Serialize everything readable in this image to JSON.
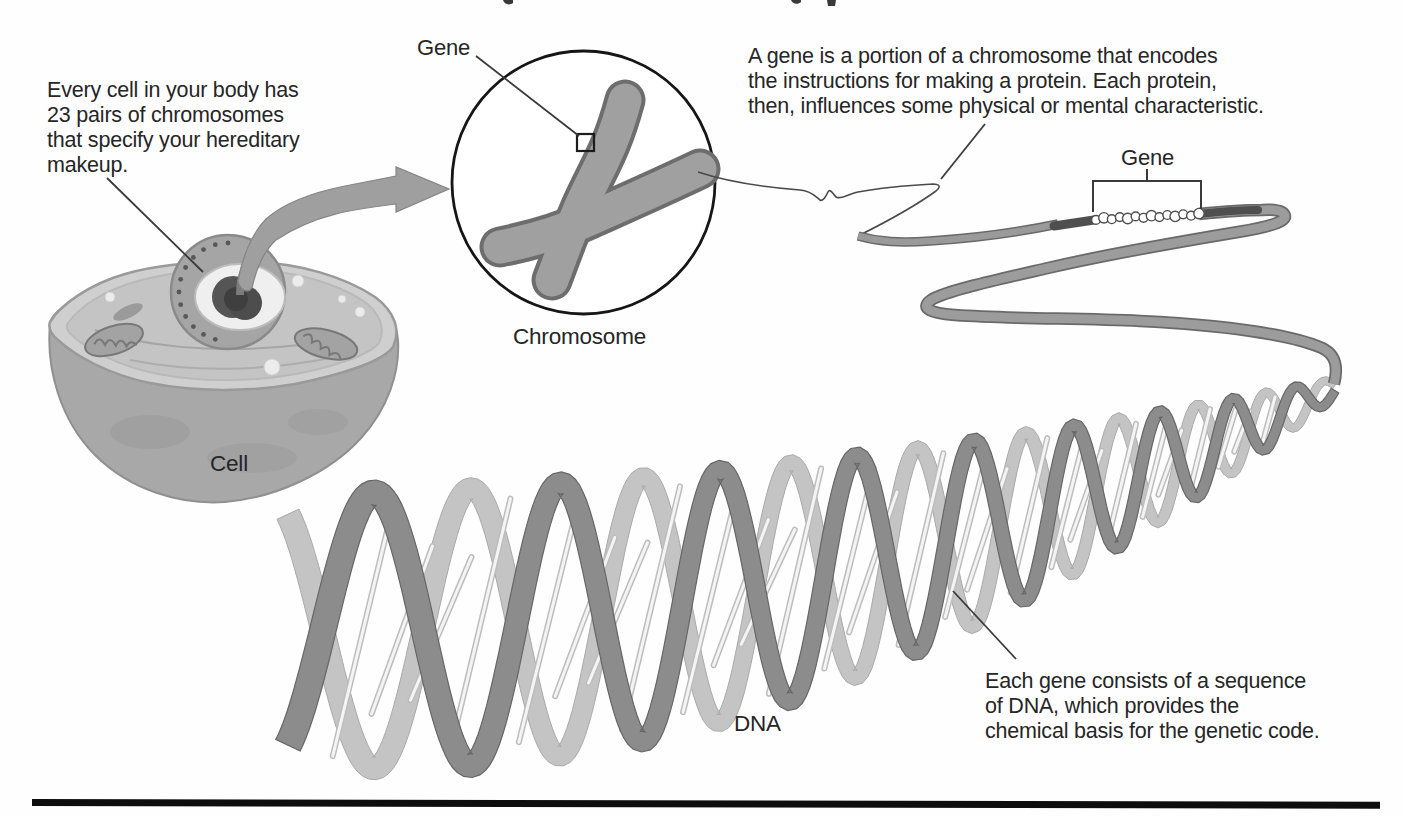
{
  "diagram": {
    "notes": {
      "cell": {
        "lines": [
          "Every cell in your body has",
          "23 pairs of chromosomes",
          "that specify your hereditary",
          "makeup."
        ]
      },
      "gene": {
        "lines": [
          "A gene is a portion of a chromosome that encodes",
          "the instructions for making a protein. Each protein,",
          "then, influences some physical or mental characteristic."
        ]
      },
      "dna": {
        "lines": [
          "Each gene consists of a sequence",
          "of DNA, which provides the",
          "chemical basis for the genetic code."
        ]
      }
    },
    "labels": {
      "gene_pointer": "Gene",
      "chromosome": "Chromosome",
      "cell": "Cell",
      "gene_bracket": "Gene",
      "dna": "DNA"
    },
    "colors": {
      "text": "#262626",
      "leader_line": "#3a3a3a",
      "outline": "#161616",
      "strand": "#9a9a9a",
      "strand_edge": "#6a6a6a",
      "strand_dark": "#4f4f4f",
      "ribbon_front": "#8c8c8c",
      "ribbon_back": "#c4c4c4",
      "rung_light": "#f4f4f4",
      "cell_body": "#a8a8a8",
      "cell_surface": "#cfcfcf",
      "cell_inner": "#c4c4c4",
      "nucleus": "#a5a5a5",
      "nucleolus": "#4d4d4d",
      "bottom_rule": "#0d0d0d",
      "background": "#fefefe"
    }
  }
}
